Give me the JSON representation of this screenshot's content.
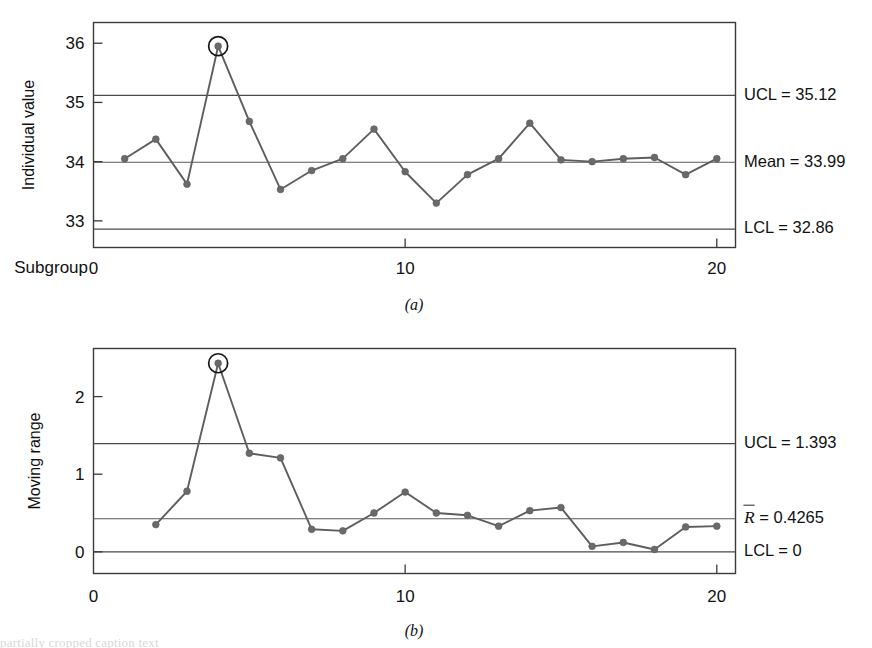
{
  "figure": {
    "panel_a_caption": "(a)",
    "panel_b_caption": "(b)"
  },
  "panel_a": {
    "ylabel": "Individual value",
    "xlabel_prefix": "Subgroup",
    "y_ticks": [
      "33",
      "34",
      "35",
      "36"
    ],
    "x_ticks": [
      "0",
      "10",
      "20"
    ],
    "ucl_label": "UCL = 35.12",
    "center_label": "Mean = 33.99",
    "lcl_label": "LCL = 32.86"
  },
  "panel_b": {
    "ylabel": "Moving range",
    "y_ticks": [
      "0",
      "1",
      "2"
    ],
    "x_ticks": [
      "0",
      "10",
      "20"
    ],
    "ucl_label": "UCL = 1.393",
    "center_label_sym": "R",
    "center_label_rest": " = 0.4265",
    "lcl_label": "LCL = 0"
  },
  "footer": {
    "text": "partially cropped caption text"
  },
  "chart_data": [
    {
      "type": "line",
      "id": "individuals-chart",
      "title": "(a)",
      "xlabel": "Subgroup",
      "ylabel": "Individual value",
      "xlim": [
        0,
        20.6
      ],
      "ylim": [
        32.55,
        36.35
      ],
      "ytick_values": [
        33,
        34,
        35,
        36
      ],
      "xtick_values": [
        0,
        10,
        20
      ],
      "grid": false,
      "legend": "none",
      "control_limits": {
        "UCL": 35.12,
        "center": 33.99,
        "LCL": 32.86,
        "UCL_text": "UCL = 35.12",
        "center_text": "Mean = 33.99",
        "LCL_text": "LCL = 32.86"
      },
      "x": [
        1,
        2,
        3,
        4,
        5,
        6,
        7,
        8,
        9,
        10,
        11,
        12,
        13,
        14,
        15,
        16,
        17,
        18,
        19,
        20
      ],
      "values": [
        34.05,
        34.38,
        33.62,
        35.95,
        34.68,
        33.53,
        33.85,
        34.05,
        34.55,
        33.83,
        33.3,
        33.78,
        34.05,
        34.65,
        34.03,
        34.0,
        34.05,
        34.07,
        33.78,
        34.05
      ],
      "out_of_control_points": [
        {
          "x": 4,
          "y": 35.95,
          "annotation": "circled"
        }
      ]
    },
    {
      "type": "line",
      "id": "moving-range-chart",
      "title": "(b)",
      "xlabel": "",
      "ylabel": "Moving range",
      "xlim": [
        0,
        20.6
      ],
      "ylim": [
        -0.28,
        2.62
      ],
      "ytick_values": [
        0,
        1,
        2
      ],
      "xtick_values": [
        0,
        10,
        20
      ],
      "grid": false,
      "legend": "none",
      "control_limits": {
        "UCL": 1.393,
        "center": 0.4265,
        "LCL": 0,
        "UCL_text": "UCL = 1.393",
        "center_text": "R̄ = 0.4265",
        "LCL_text": "LCL = 0"
      },
      "x": [
        2,
        3,
        4,
        5,
        6,
        7,
        8,
        9,
        10,
        11,
        12,
        13,
        14,
        15,
        16,
        17,
        18,
        19,
        20
      ],
      "values": [
        0.35,
        0.78,
        2.43,
        1.27,
        1.21,
        0.29,
        0.27,
        0.5,
        0.77,
        0.5,
        0.47,
        0.33,
        0.53,
        0.57,
        0.07,
        0.12,
        0.03,
        0.32,
        0.33
      ],
      "out_of_control_points": [
        {
          "x": 4,
          "y": 2.43,
          "annotation": "circled"
        }
      ]
    }
  ]
}
